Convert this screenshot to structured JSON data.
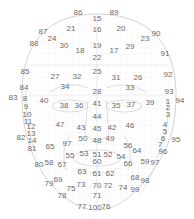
{
  "diagram": {
    "colors": {
      "outline": "#c8c8c8",
      "grid": "#ececec",
      "label": "#6a6a6a"
    },
    "labels": [
      {
        "id": "86",
        "x": 78,
        "y": 13
      },
      {
        "id": "15",
        "x": 97,
        "y": 19
      },
      {
        "id": "89",
        "x": 114,
        "y": 13
      },
      {
        "id": "87",
        "x": 43,
        "y": 32
      },
      {
        "id": "21",
        "x": 71,
        "y": 29
      },
      {
        "id": "16",
        "x": 97,
        "y": 30
      },
      {
        "id": "20",
        "x": 121,
        "y": 29
      },
      {
        "id": "90",
        "x": 156,
        "y": 34
      },
      {
        "id": "24",
        "x": 52,
        "y": 39
      },
      {
        "id": "23",
        "x": 145,
        "y": 39
      },
      {
        "id": "88",
        "x": 34,
        "y": 44
      },
      {
        "id": "30",
        "x": 64,
        "y": 46
      },
      {
        "id": "19",
        "x": 97,
        "y": 46
      },
      {
        "id": "29",
        "x": 130,
        "y": 47
      },
      {
        "id": "18",
        "x": 80,
        "y": 51
      },
      {
        "id": "17",
        "x": 114,
        "y": 51
      },
      {
        "id": "91",
        "x": 165,
        "y": 54
      },
      {
        "id": "22",
        "x": 97,
        "y": 58
      },
      {
        "id": "85",
        "x": 25,
        "y": 72
      },
      {
        "id": "27",
        "x": 55,
        "y": 77
      },
      {
        "id": "32",
        "x": 77,
        "y": 77
      },
      {
        "id": "25",
        "x": 97,
        "y": 72
      },
      {
        "id": "31",
        "x": 116,
        "y": 78
      },
      {
        "id": "26",
        "x": 138,
        "y": 78
      },
      {
        "id": "92",
        "x": 168,
        "y": 75
      },
      {
        "id": "84",
        "x": 24,
        "y": 88
      },
      {
        "id": "34",
        "x": 65,
        "y": 87
      },
      {
        "id": "33",
        "x": 130,
        "y": 88
      },
      {
        "id": "28",
        "x": 97,
        "y": 92
      },
      {
        "id": "93",
        "x": 169,
        "y": 92
      },
      {
        "id": "83",
        "x": 13,
        "y": 98
      },
      {
        "id": "8",
        "x": 25,
        "y": 99
      },
      {
        "id": "40",
        "x": 44,
        "y": 101
      },
      {
        "id": "38",
        "x": 64,
        "y": 106
      },
      {
        "id": "36",
        "x": 79,
        "y": 106
      },
      {
        "id": "41",
        "x": 97,
        "y": 104
      },
      {
        "id": "35",
        "x": 116,
        "y": 106
      },
      {
        "id": "37",
        "x": 131,
        "y": 105
      },
      {
        "id": "39",
        "x": 150,
        "y": 103
      },
      {
        "id": "1",
        "x": 168,
        "y": 102
      },
      {
        "id": "94",
        "x": 180,
        "y": 101
      },
      {
        "id": "9",
        "x": 26,
        "y": 107
      },
      {
        "id": "2",
        "x": 168,
        "y": 108
      },
      {
        "id": "10",
        "x": 27,
        "y": 115
      },
      {
        "id": "44",
        "x": 97,
        "y": 117
      },
      {
        "id": "3",
        "x": 168,
        "y": 115
      },
      {
        "id": "11",
        "x": 28,
        "y": 122
      },
      {
        "id": "43",
        "x": 81,
        "y": 128
      },
      {
        "id": "45",
        "x": 97,
        "y": 129
      },
      {
        "id": "42",
        "x": 112,
        "y": 128
      },
      {
        "id": "4",
        "x": 165,
        "y": 125
      },
      {
        "id": "12",
        "x": 31,
        "y": 127
      },
      {
        "id": "47",
        "x": 60,
        "y": 125
      },
      {
        "id": "46",
        "x": 130,
        "y": 126
      },
      {
        "id": "5",
        "x": 165,
        "y": 132
      },
      {
        "id": "82",
        "x": 21,
        "y": 138
      },
      {
        "id": "13",
        "x": 31,
        "y": 134
      },
      {
        "id": "50",
        "x": 83,
        "y": 139
      },
      {
        "id": "48",
        "x": 97,
        "y": 141
      },
      {
        "id": "49",
        "x": 110,
        "y": 139
      },
      {
        "id": "6",
        "x": 163,
        "y": 139
      },
      {
        "id": "95",
        "x": 176,
        "y": 140
      },
      {
        "id": "14",
        "x": 32,
        "y": 141
      },
      {
        "id": "97",
        "x": 67,
        "y": 144
      },
      {
        "id": "56",
        "x": 128,
        "y": 146
      },
      {
        "id": "7",
        "x": 160,
        "y": 145
      },
      {
        "id": "81",
        "x": 32,
        "y": 149
      },
      {
        "id": "65",
        "x": 50,
        "y": 147
      },
      {
        "id": "64",
        "x": 137,
        "y": 151
      },
      {
        "id": "96",
        "x": 163,
        "y": 152
      },
      {
        "id": "55",
        "x": 70,
        "y": 156
      },
      {
        "id": "53",
        "x": 84,
        "y": 154
      },
      {
        "id": "51",
        "x": 97,
        "y": 155
      },
      {
        "id": "52",
        "x": 108,
        "y": 155
      },
      {
        "id": "54",
        "x": 121,
        "y": 157
      },
      {
        "id": "80",
        "x": 39,
        "y": 165
      },
      {
        "id": "58",
        "x": 49,
        "y": 163
      },
      {
        "id": "67",
        "x": 62,
        "y": 165
      },
      {
        "id": "60",
        "x": 97,
        "y": 162
      },
      {
        "id": "66",
        "x": 128,
        "y": 164
      },
      {
        "id": "59",
        "x": 145,
        "y": 162
      },
      {
        "id": "97b",
        "x": 155,
        "y": 163
      },
      {
        "id": "63",
        "x": 82,
        "y": 172
      },
      {
        "id": "61",
        "x": 97,
        "y": 174
      },
      {
        "id": "62",
        "x": 110,
        "y": 174
      },
      {
        "id": "68",
        "x": 135,
        "y": 178
      },
      {
        "id": "98",
        "x": 145,
        "y": 181
      },
      {
        "id": "79",
        "x": 49,
        "y": 184
      },
      {
        "id": "69",
        "x": 58,
        "y": 180
      },
      {
        "id": "73",
        "x": 81,
        "y": 185
      },
      {
        "id": "70",
        "x": 97,
        "y": 186
      },
      {
        "id": "72",
        "x": 108,
        "y": 186
      },
      {
        "id": "74",
        "x": 123,
        "y": 188
      },
      {
        "id": "99",
        "x": 135,
        "y": 190
      },
      {
        "id": "75",
        "x": 71,
        "y": 189
      },
      {
        "id": "78",
        "x": 62,
        "y": 196
      },
      {
        "id": "71",
        "x": 97,
        "y": 196
      },
      {
        "id": "77",
        "x": 82,
        "y": 207
      },
      {
        "id": "100",
        "x": 95,
        "y": 208
      },
      {
        "id": "76",
        "x": 106,
        "y": 207
      }
    ]
  }
}
